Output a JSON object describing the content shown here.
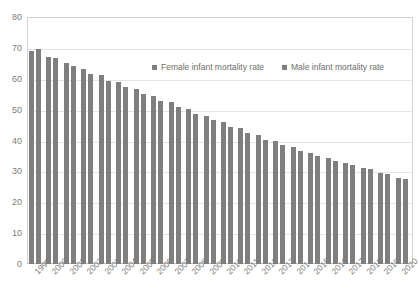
{
  "chart_data": {
    "type": "bar",
    "title": "",
    "xlabel": "",
    "ylabel": "",
    "ylim": [
      0,
      80
    ],
    "ytick_step": 10,
    "grid": true,
    "legend_position": "top-center",
    "bar_color": "#7f7f7f",
    "categories": [
      "1999",
      "2000",
      "2001",
      "2002",
      "2003",
      "2004",
      "2005",
      "2006",
      "2007",
      "2008",
      "2009",
      "2010",
      "2011",
      "2012",
      "2013",
      "2014",
      "2015",
      "2016",
      "2017",
      "2018",
      "2019",
      "2020"
    ],
    "series": [
      {
        "name": "Female infant mortality rate",
        "color": "#7f7f7f",
        "values": [
          69.0,
          67.2,
          65.0,
          63.1,
          61.1,
          58.8,
          56.7,
          54.4,
          52.5,
          50.2,
          48.1,
          46.0,
          43.9,
          41.8,
          39.8,
          37.8,
          35.9,
          34.2,
          32.6,
          31.2,
          29.6,
          28.0
        ]
      },
      {
        "name": "Male infant mortality rate",
        "color": "#7f7f7f",
        "values": [
          69.5,
          66.6,
          64.1,
          61.5,
          59.2,
          57.3,
          55.0,
          52.9,
          50.8,
          48.6,
          46.5,
          44.4,
          42.3,
          40.3,
          38.4,
          36.6,
          35.0,
          33.5,
          32.0,
          30.7,
          29.2,
          27.6
        ]
      }
    ],
    "yticks": [
      "0",
      "10",
      "20",
      "30",
      "40",
      "50",
      "60",
      "70",
      "80"
    ]
  },
  "legend": {
    "items": [
      {
        "label": "Female infant mortality rate",
        "marker": "square-marker"
      },
      {
        "label": "Male infant mortality rate",
        "marker": "square-marker"
      }
    ]
  }
}
